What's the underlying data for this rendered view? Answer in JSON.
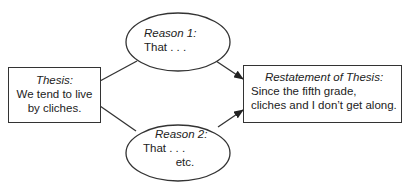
{
  "diagram": {
    "type": "flow",
    "nodes": {
      "thesis": {
        "shape": "rectangle",
        "title": "Thesis:",
        "lines": [
          "We tend to live",
          "by cliches."
        ]
      },
      "reason1": {
        "shape": "ellipse",
        "title": "Reason 1:",
        "lines": [
          "That . . ."
        ]
      },
      "reason2": {
        "shape": "ellipse",
        "title": "Reason 2:",
        "lines": [
          "That . . .",
          "etc."
        ]
      },
      "restatement": {
        "shape": "rectangle",
        "title": "Restatement of Thesis:",
        "lines": [
          "Since the fifth grade,",
          "cliches and I don’t get along."
        ]
      }
    },
    "edges": [
      {
        "from": "thesis",
        "to": "reason1",
        "arrow": false
      },
      {
        "from": "thesis",
        "to": "reason2",
        "arrow": false
      },
      {
        "from": "reason1",
        "to": "restatement",
        "arrow": true
      },
      {
        "from": "reason2",
        "to": "restatement",
        "arrow": true
      }
    ],
    "colors": {
      "stroke": "#333333",
      "text": "#222222",
      "background": "#ffffff"
    }
  }
}
